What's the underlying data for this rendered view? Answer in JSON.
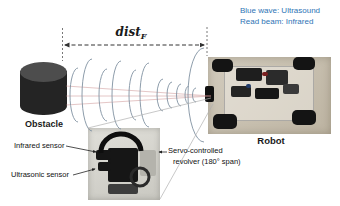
{
  "figure": {
    "legend": {
      "line1": "Blue wave: Ultrasound",
      "line2": "Read beam: Infrared"
    },
    "distance": {
      "base": "dist",
      "subscript": "F"
    },
    "obstacle_label": "Obstacle",
    "robot_label": "Robot",
    "callouts": {
      "infrared": "Infrared sensor",
      "ultrasonic": "Ultrasonic sensor",
      "servo_line1": "Servo-controlled",
      "servo_line2": "revolver (180° span)"
    },
    "colors": {
      "legend_text": "#2E74B5",
      "wave_arc": "#8293a3",
      "infrared_beam": "#c98a8a"
    }
  }
}
